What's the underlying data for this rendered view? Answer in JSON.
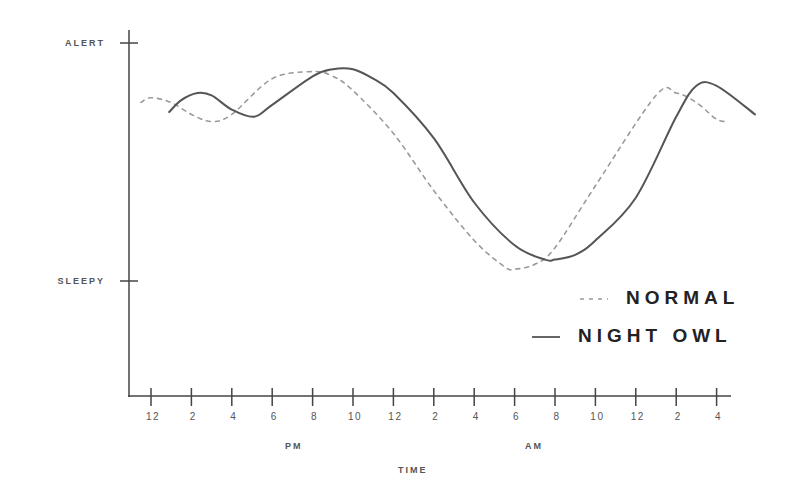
{
  "chart_data": {
    "type": "line",
    "title": "",
    "xlabel": "TIME",
    "ylabel": "",
    "y_tick_labels": [
      "ALERT",
      "SLEEPY"
    ],
    "x_tick_labels": [
      "12",
      "2",
      "4",
      "6",
      "8",
      "10",
      "12",
      "2",
      "4",
      "6",
      "8",
      "10",
      "12",
      "2",
      "4"
    ],
    "x_group_labels": [
      "PM",
      "AM"
    ],
    "ylim": [
      0,
      100
    ],
    "y_ticks": {
      "ALERT": 100,
      "SLEEPY": 0
    },
    "grid": false,
    "legend_position": "lower right",
    "x_unit": "hours after 12 PM",
    "series": [
      {
        "name": "NORMAL",
        "style": "dashed",
        "color": "#9a9a9a",
        "x": [
          -0.5,
          0.0,
          1.0,
          2.0,
          3.0,
          4.0,
          6.0,
          8.0,
          9.0,
          10.0,
          12.0,
          14.0,
          16.0,
          17.5,
          18.0,
          19.0,
          20.0,
          22.0,
          25.0,
          26.0,
          27.0,
          28.0,
          28.6
        ],
        "y": [
          75,
          77,
          75,
          70,
          67,
          70,
          85,
          88,
          86,
          80,
          62,
          38,
          17,
          6,
          5,
          7,
          14,
          40,
          78,
          79,
          75,
          68,
          67
        ]
      },
      {
        "name": "NIGHT OWL",
        "style": "solid",
        "color": "#555555",
        "x": [
          0.9,
          1.5,
          2.3,
          3.0,
          4.0,
          5.1,
          6.0,
          8.0,
          9.0,
          10.0,
          11.0,
          12.0,
          14.0,
          16.0,
          18.0,
          19.5,
          20.0,
          21.0,
          22.0,
          24.0,
          26.0,
          27.0,
          28.0,
          29.9
        ],
        "y": [
          71,
          76,
          79,
          78,
          72,
          69,
          74,
          86,
          89,
          89,
          85,
          79,
          60,
          33,
          15,
          9,
          9,
          11,
          17,
          35,
          69,
          82,
          82,
          70
        ]
      }
    ]
  },
  "axes": {
    "y_labels": {
      "alert": "ALERT",
      "sleepy": "SLEEPY"
    },
    "x_title": "TIME",
    "x_groups": {
      "pm": "PM",
      "am": "AM"
    }
  },
  "legend": {
    "normal": "NORMAL",
    "night_owl": "NIGHT OWL"
  }
}
